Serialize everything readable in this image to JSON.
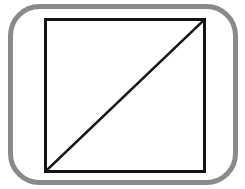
{
  "canvas": {
    "width": 245,
    "height": 189,
    "background_color": "#ffffff",
    "title": "Square with diagonal inside rounded rectangle"
  },
  "figure": {
    "name": "square-with-diagonal-in-rounded-frame",
    "description": "A gray rounded-rectangle frame enclosing a black square that is divided by a single diagonal line running from the lower-left corner to the upper-right corner.",
    "shapes": [
      {
        "id": "rounded-frame",
        "type": "rounded-rectangle",
        "label": "Outer rounded rectangle frame",
        "stroke_color": "#8a8a8a",
        "stroke_width": 5,
        "fill": "none",
        "x": 10.5,
        "y": 6.5,
        "width": 225,
        "height": 176,
        "corner_radius": 29
      },
      {
        "id": "inner-square",
        "type": "rectangle",
        "label": "Inner black square",
        "stroke_color": "#141414",
        "stroke_width": 3,
        "fill": "none",
        "x": 45.5,
        "y": 19.5,
        "width": 159,
        "height": 152
      },
      {
        "id": "diagonal-line",
        "type": "line",
        "label": "Diagonal from bottom-left to top-right",
        "stroke_color": "#171717",
        "stroke_width": 2.6,
        "x1": 46,
        "y1": 171,
        "x2": 204,
        "y2": 20
      }
    ]
  },
  "colors": {
    "frame_gray": "#8a8a8a",
    "square_black": "#141414",
    "diagonal_black": "#171717",
    "background_white": "#ffffff"
  }
}
